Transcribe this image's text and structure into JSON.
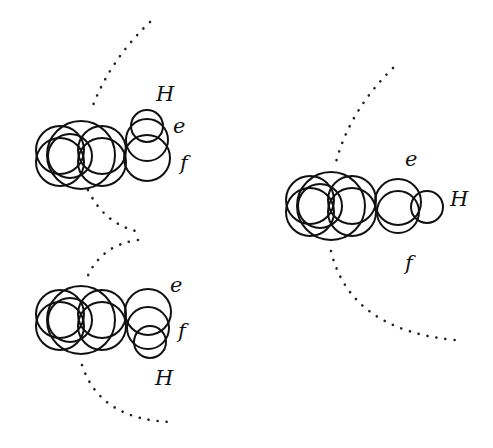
{
  "diagram": {
    "type": "molecular orientation sketch",
    "molecules": [
      {
        "id": "top-left",
        "labels": {
          "H": "H",
          "e": "e",
          "f": "f"
        },
        "h_position": "up"
      },
      {
        "id": "bottom-left",
        "labels": {
          "H": "H",
          "e": "e",
          "f": "f"
        },
        "h_position": "down"
      },
      {
        "id": "right",
        "labels": {
          "H": "H",
          "e": "e",
          "f": "f"
        },
        "h_position": "right"
      }
    ],
    "colors": {
      "stroke": "#111111",
      "background": "#ffffff"
    }
  }
}
